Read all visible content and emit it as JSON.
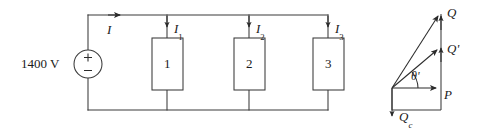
{
  "figure": {
    "name": "parallel-loads-circuit-and-power-triangle",
    "background_color": "#ffffff",
    "line_color": "#3a3a3a",
    "text_color": "#1a1a1a"
  },
  "circuit": {
    "source": {
      "voltage_label": "1400 V",
      "plus_symbol": "+",
      "minus_symbol": "−",
      "icon": "voltage-source-icon"
    },
    "currents": [
      {
        "label": "I",
        "base": "I",
        "subscript": ""
      },
      {
        "label": "I1",
        "base": "I",
        "subscript": "1"
      },
      {
        "label": "I2",
        "base": "I",
        "subscript": "2"
      },
      {
        "label": "I3",
        "base": "I",
        "subscript": "3"
      }
    ],
    "loads": [
      {
        "label": "1"
      },
      {
        "label": "2"
      },
      {
        "label": "3"
      }
    ]
  },
  "phasor": {
    "title": "",
    "vectors": [
      {
        "name": "P",
        "label": "P",
        "base": "P",
        "prime": false,
        "subscript": ""
      },
      {
        "name": "Q",
        "label": "Q",
        "base": "Q",
        "prime": false,
        "subscript": ""
      },
      {
        "name": "Qp",
        "label": "Q'",
        "base": "Q",
        "prime": true,
        "subscript": ""
      },
      {
        "name": "Qc",
        "label": "Qc",
        "base": "Q",
        "prime": false,
        "subscript": "c"
      }
    ],
    "angle": {
      "label": "θ'",
      "base": "θ",
      "prime": true
    }
  }
}
